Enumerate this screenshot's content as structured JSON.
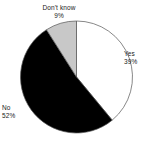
{
  "chart_data": {
    "type": "pie",
    "title": "",
    "subtitle": "",
    "xlabel": "",
    "ylabel": "",
    "legend_position": "none",
    "grid": false,
    "start_angle_deg": 0,
    "direction": "clockwise",
    "categories": [
      "Yes",
      "No",
      "Don't know"
    ],
    "values": [
      39,
      52,
      9
    ],
    "value_unit": "%",
    "colors": [
      "#ffffff",
      "#000000",
      "#c8c8c8"
    ],
    "outline_color": "#555555",
    "slices": [
      {
        "label": "Yes",
        "value": 39,
        "percent_text": "39%",
        "color": "#ffffff",
        "start_deg": 0,
        "end_deg": 140.4
      },
      {
        "label": "No",
        "value": 52,
        "percent_text": "52%",
        "color": "#000000",
        "start_deg": 140.4,
        "end_deg": 327.6
      },
      {
        "label": "Don't know",
        "value": 9,
        "percent_text": "9%",
        "color": "#c8c8c8",
        "start_deg": 327.6,
        "end_deg": 360
      }
    ]
  },
  "labels": {
    "yes": {
      "name": "Yes",
      "percent": "39%"
    },
    "no": {
      "name": "No",
      "percent": "52%"
    },
    "dont_know": {
      "name": "Don't know",
      "percent": "9%"
    }
  }
}
